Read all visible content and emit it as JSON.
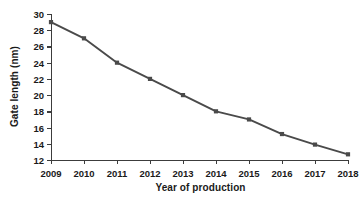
{
  "chart_data": {
    "type": "line",
    "title": "",
    "xlabel": "Year of production",
    "ylabel": "Gate length (nm)",
    "categories": [
      "2009",
      "2010",
      "2011",
      "2012",
      "2013",
      "2014",
      "2015",
      "2016",
      "2017",
      "2018"
    ],
    "x": [
      2009,
      2010,
      2011,
      2012,
      2013,
      2014,
      2015,
      2016,
      2017,
      2018
    ],
    "values": [
      29,
      27,
      24,
      22,
      20,
      18,
      17,
      15.2,
      13.9,
      12.7
    ],
    "series": [
      {
        "name": "Gate length",
        "values": [
          29,
          27,
          24,
          22,
          20,
          18,
          17,
          15.2,
          13.9,
          12.7
        ]
      }
    ],
    "xlim": [
      2009,
      2018
    ],
    "ylim": [
      12,
      30
    ],
    "ytick_labels": [
      "12",
      "14",
      "16",
      "18",
      "20",
      "22",
      "24",
      "26",
      "28",
      "30"
    ],
    "yticks": [
      12,
      14,
      16,
      18,
      20,
      22,
      24,
      26,
      28,
      30
    ],
    "xtick_labels": [
      "2009",
      "2010",
      "2011",
      "2012",
      "2013",
      "2014",
      "2015",
      "2016",
      "2017",
      "2018"
    ],
    "grid": false,
    "legend": null,
    "marker": "square",
    "line_color": "#4a4a4a",
    "marker_color": "#4a4a4a",
    "axis_color": "#3c3c3c",
    "background": "#ffffff"
  }
}
